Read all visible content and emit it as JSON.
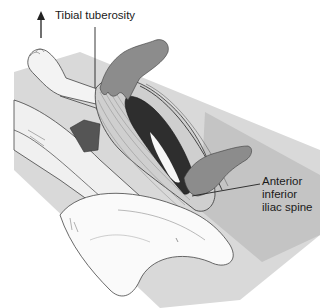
{
  "figure": {
    "colors": {
      "background": "#ffffff",
      "table": "#d6d6d6",
      "table_shadow": "#bdbdbd",
      "skin": "#f2f2f2",
      "drape": "#fafafa",
      "hand": "#8c8c8c",
      "muscle_light": "#cfcfcf",
      "muscle_dark": "#2e2e2e",
      "tendon": "#f5f5f5",
      "outline": "#333333"
    }
  },
  "labels": {
    "tibial_tuberosity": "Tibial tuberosity",
    "aiis_line1": "Anterior",
    "aiis_line2": "inferior",
    "aiis_line3": "iliac spine"
  },
  "annotations": {
    "direction_arrow": "up-arrow"
  }
}
